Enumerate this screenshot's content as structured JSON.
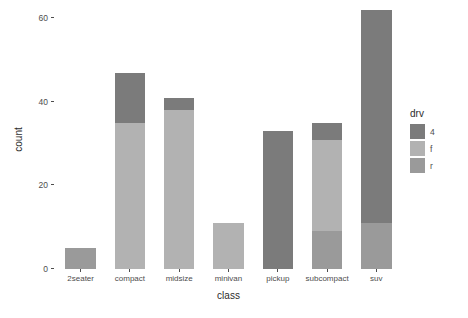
{
  "chart_data": {
    "type": "bar",
    "stacked": true,
    "title": "",
    "xlabel": "class",
    "ylabel": "count",
    "categories": [
      "2seater",
      "compact",
      "midsize",
      "minivan",
      "pickup",
      "subcompact",
      "suv"
    ],
    "ylim": [
      0,
      62
    ],
    "yticks": [
      0,
      20,
      40,
      60
    ],
    "ytick_labels": [
      "0",
      "20",
      "40",
      "60"
    ],
    "grid": false,
    "legend": {
      "title": "drv",
      "position": "right",
      "entries": [
        {
          "label": "4",
          "color": "#7b7b7b"
        },
        {
          "label": "f",
          "color": "#b2b2b2"
        },
        {
          "label": "r",
          "color": "#9a9a9a"
        }
      ]
    },
    "series": [
      {
        "name": "4",
        "color": "#7b7b7b",
        "values": [
          0,
          12,
          3,
          0,
          33,
          4,
          51
        ]
      },
      {
        "name": "f",
        "color": "#b2b2b2",
        "values": [
          0,
          35,
          38,
          11,
          0,
          22,
          0
        ]
      },
      {
        "name": "r",
        "color": "#9a9a9a",
        "values": [
          5,
          0,
          0,
          0,
          0,
          9,
          11
        ]
      }
    ],
    "totals": [
      5,
      47,
      41,
      11,
      33,
      35,
      62
    ]
  },
  "colors": {
    "background": "#ffffff",
    "axis_text": "#4d4d4d",
    "axis_title": "#2b2b2b",
    "drv_4": "#7b7b7b",
    "drv_f": "#b2b2b2",
    "drv_r": "#9a9a9a"
  }
}
